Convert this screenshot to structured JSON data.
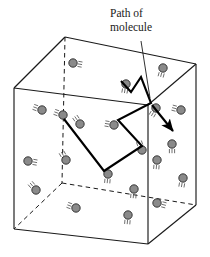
{
  "figure": {
    "title": "",
    "annotation": {
      "line1": "Path of",
      "line2": "molecule",
      "leader_from": [
        141,
        41
      ],
      "leader_to": [
        150,
        98
      ]
    },
    "colors": {
      "molecule_fill": "#8a8a8a",
      "molecule_stroke": "#2b2b2b",
      "box_stroke": "#1a1a1a",
      "path_stroke": "#000000",
      "background": "#ffffff",
      "motion_lines": "#555555"
    },
    "container": {
      "name": "cube",
      "description": "Transparent cubical box drawn in oblique projection; hidden rear edges dashed.",
      "vertices": {
        "front_top_left": [
          14,
          88
        ],
        "front_top_right": [
          148,
          105
        ],
        "front_bottom_left": [
          14,
          229
        ],
        "front_bottom_right": [
          148,
          244
        ],
        "back_top_left": [
          65,
          37
        ],
        "back_top_right": [
          196,
          64
        ],
        "back_bottom_left": [
          62,
          183
        ],
        "back_bottom_right": [
          196,
          205
        ]
      },
      "solid_edges": [
        [
          [
            14,
            88
          ],
          [
            148,
            105
          ]
        ],
        [
          [
            14,
            88
          ],
          [
            14,
            229
          ]
        ],
        [
          [
            148,
            105
          ],
          [
            148,
            244
          ]
        ],
        [
          [
            14,
            229
          ],
          [
            148,
            244
          ]
        ],
        [
          [
            14,
            88
          ],
          [
            65,
            37
          ]
        ],
        [
          [
            148,
            105
          ],
          [
            196,
            64
          ]
        ],
        [
          [
            65,
            37
          ],
          [
            196,
            64
          ]
        ],
        [
          [
            196,
            64
          ],
          [
            196,
            205
          ]
        ],
        [
          [
            148,
            244
          ],
          [
            196,
            205
          ]
        ]
      ],
      "dashed_edges": [
        [
          [
            65,
            37
          ],
          [
            62,
            183
          ]
        ],
        [
          [
            62,
            183
          ],
          [
            14,
            229
          ]
        ],
        [
          [
            62,
            183
          ],
          [
            196,
            205
          ]
        ]
      ]
    },
    "molecule_path": {
      "name": "path-of-molecule",
      "points": [
        [
          121,
          81
        ],
        [
          131,
          92
        ],
        [
          141,
          77
        ],
        [
          151,
          103
        ],
        [
          118,
          120
        ],
        [
          142,
          146
        ],
        [
          104,
          171
        ],
        [
          64,
          119
        ]
      ],
      "arrow_from": [
        152,
        105
      ],
      "arrow_to": [
        173,
        131
      ],
      "stroke_width": 2.1
    },
    "molecules": [
      {
        "cx": 73,
        "cy": 63,
        "angle": 10
      },
      {
        "cx": 126,
        "cy": 84,
        "angle": 100
      },
      {
        "cx": 163,
        "cy": 68,
        "angle": 105
      },
      {
        "cx": 42,
        "cy": 110,
        "angle": 200
      },
      {
        "cx": 63,
        "cy": 115,
        "angle": 200
      },
      {
        "cx": 80,
        "cy": 124,
        "angle": 235
      },
      {
        "cx": 114,
        "cy": 125,
        "angle": 190
      },
      {
        "cx": 156,
        "cy": 108,
        "angle": 120
      },
      {
        "cx": 181,
        "cy": 110,
        "angle": 195
      },
      {
        "cx": 172,
        "cy": 144,
        "angle": 90
      },
      {
        "cx": 142,
        "cy": 150,
        "angle": 250
      },
      {
        "cx": 28,
        "cy": 161,
        "angle": 10
      },
      {
        "cx": 66,
        "cy": 160,
        "angle": 240
      },
      {
        "cx": 108,
        "cy": 174,
        "angle": 95
      },
      {
        "cx": 134,
        "cy": 189,
        "angle": 95
      },
      {
        "cx": 157,
        "cy": 160,
        "angle": 95
      },
      {
        "cx": 36,
        "cy": 190,
        "angle": 230
      },
      {
        "cx": 76,
        "cy": 208,
        "angle": 200
      },
      {
        "cx": 128,
        "cy": 215,
        "angle": 95
      },
      {
        "cx": 157,
        "cy": 203,
        "angle": 15
      },
      {
        "cx": 183,
        "cy": 178,
        "angle": 100
      }
    ],
    "molecule_radius": 4.2
  }
}
